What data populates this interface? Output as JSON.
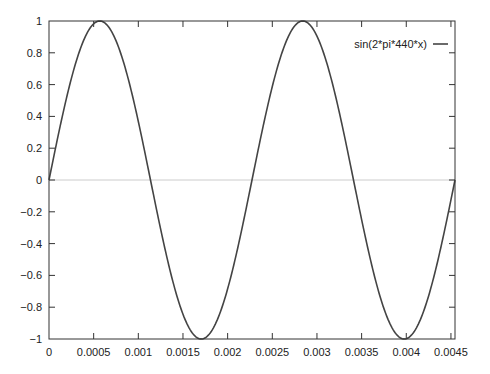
{
  "chart_data": {
    "type": "line",
    "title": "",
    "xlabel": "",
    "ylabel": "",
    "xlim": [
      0,
      0.0045454545
    ],
    "ylim": [
      -1,
      1
    ],
    "grid": false,
    "zero_axis": true,
    "legend_position": "top-right",
    "x_ticks": [
      "0",
      "0.0005",
      "0.001",
      "0.0015",
      "0.002",
      "0.0025",
      "0.003",
      "0.0035",
      "0.004",
      "0.0045"
    ],
    "x_tick_values": [
      0,
      0.0005,
      0.001,
      0.0015,
      0.002,
      0.0025,
      0.003,
      0.0035,
      0.004,
      0.0045
    ],
    "y_ticks": [
      "1",
      "0.8",
      "0.6",
      "0.4",
      "0.2",
      "0",
      "-0.2",
      "-0.4",
      "-0.6",
      "-0.8",
      "-1"
    ],
    "y_tick_values": [
      1,
      0.8,
      0.6,
      0.4,
      0.2,
      0,
      -0.2,
      -0.4,
      -0.6,
      -0.8,
      -1
    ],
    "series": [
      {
        "name": "sin(2*pi*440*x)",
        "color": "#444444",
        "function": "sin(2*pi*440*x)",
        "x": [
          0,
          0.000284,
          0.000568,
          0.000852,
          0.001136,
          0.00142,
          0.001705,
          0.001989,
          0.002273,
          0.002557,
          0.002841,
          0.003125,
          0.003409,
          0.003693,
          0.003977,
          0.004261,
          0.004545
        ],
        "y": [
          0,
          0.707,
          1,
          0.707,
          0,
          -0.707,
          -1,
          -0.707,
          0,
          0.707,
          1,
          0.707,
          0,
          -0.707,
          -1,
          -0.707,
          0
        ]
      }
    ]
  },
  "colors": {
    "frame": "#333333",
    "curve": "#444444",
    "zero_line": "#cccccc"
  }
}
